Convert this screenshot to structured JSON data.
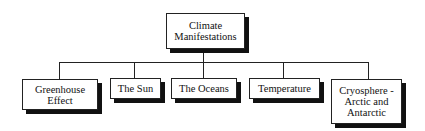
{
  "diagram": {
    "root": {
      "label_line1": "Climate",
      "label_line2": "Manifestations"
    },
    "children": [
      {
        "label_line1": "Greenhouse",
        "label_line2": "Effect"
      },
      {
        "label_line1": "The Sun"
      },
      {
        "label_line1": "The Oceans"
      },
      {
        "label_line1": "Temperature"
      },
      {
        "label_line1": "Cryosphere -",
        "label_line2": "Arctic and",
        "label_line3": "Antarctic"
      }
    ],
    "colors": {
      "line": "#222222",
      "shadow": "#111111",
      "box_fill": "#ffffff"
    }
  }
}
